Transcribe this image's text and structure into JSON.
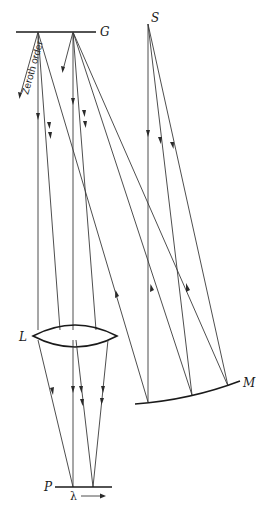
{
  "diagram": {
    "title": "",
    "type": "spectrograph optical layout",
    "labels": {
      "grating": "G",
      "source": "S",
      "lens": "L",
      "mirror": "M",
      "plate": "P",
      "wavelength": "λ",
      "zeroth_order": "Zeroth order"
    },
    "components": [
      {
        "id": "G",
        "name": "diffraction grating"
      },
      {
        "id": "S",
        "name": "source slit"
      },
      {
        "id": "M",
        "name": "concave mirror"
      },
      {
        "id": "L",
        "name": "converging lens"
      },
      {
        "id": "P",
        "name": "photographic plate"
      }
    ],
    "connections": [
      {
        "from": "S",
        "to": "M",
        "rays": 3
      },
      {
        "from": "M",
        "to": "G",
        "rays": 3
      },
      {
        "from": "G",
        "to": "L",
        "rays": 6
      },
      {
        "from": "L",
        "to": "P",
        "rays": 6
      },
      {
        "from": "G",
        "direction": "zeroth order",
        "rays": 2
      }
    ],
    "colors": {
      "line": "#3a3a3a",
      "background": "#ffffff"
    }
  }
}
